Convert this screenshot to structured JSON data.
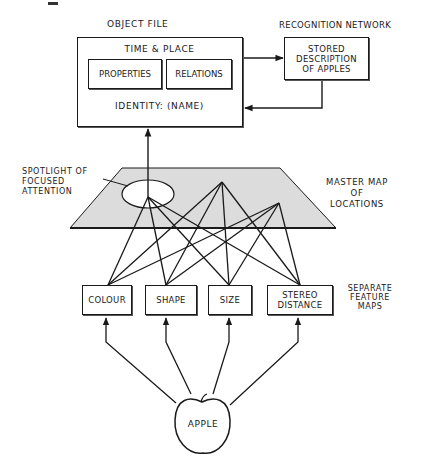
{
  "diagram": {
    "type": "cognitive-model",
    "colors": {
      "ink": "#1a1a1a",
      "map_fill": "#dcdcdc",
      "background": "#ffffff"
    },
    "object_file": {
      "title": "OBJECT FILE",
      "time_place": "TIME & PLACE",
      "properties": "PROPERTIES",
      "relations": "RELATIONS",
      "identity": "IDENTITY: (NAME)"
    },
    "recognition_network": {
      "title": "RECOGNITION NETWORK",
      "stored_description": "STORED DESCRIPTION OF APPLES",
      "stored_lines": [
        "STORED",
        "DESCRIPTION",
        "OF APPLES"
      ]
    },
    "spotlight": {
      "lines": [
        "SPOTLIGHT OF",
        "FOCUSED",
        "ATTENTION"
      ]
    },
    "master_map": {
      "lines": [
        "MASTER MAP",
        "OF",
        "LOCATIONS"
      ]
    },
    "feature_maps": {
      "label_lines": [
        "SEPARATE",
        "FEATURE",
        "MAPS"
      ],
      "items": [
        {
          "label": "COLOUR"
        },
        {
          "label": "SHAPE"
        },
        {
          "label": "SIZE"
        },
        {
          "label": "STEREO DISTANCE",
          "lines": [
            "STEREO",
            "DISTANCE"
          ]
        }
      ]
    },
    "stimulus": {
      "label": "APPLE"
    },
    "edges": [
      {
        "from": "apple",
        "to": "colour"
      },
      {
        "from": "apple",
        "to": "shape"
      },
      {
        "from": "apple",
        "to": "size"
      },
      {
        "from": "apple",
        "to": "stereo-distance"
      },
      {
        "from": "feature-maps",
        "to": "master-map",
        "count": 12
      },
      {
        "from": "spotlight",
        "to": "object-file"
      },
      {
        "from": "object-file",
        "to": "recognition-network"
      },
      {
        "from": "recognition-network",
        "to": "object-file"
      }
    ]
  }
}
